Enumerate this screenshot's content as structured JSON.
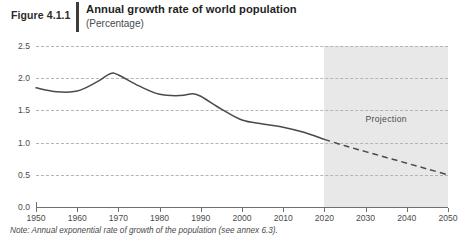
{
  "header": {
    "figure_number": "Figure 4.1.1",
    "title": "Annual growth rate of world population",
    "subtitle": "(Percentage)"
  },
  "note": "Note: Annual exponential rate of growth of the population (see annex 6.3).",
  "colors": {
    "line": "#4a4a4a",
    "grid": "#b4b4b4",
    "band": "#e8e8e8",
    "axis": "#6f6f6f",
    "text": "#4c4c4c"
  },
  "chart_data": {
    "type": "line",
    "title": "Annual growth rate of world population",
    "subtitle": "(Percentage)",
    "xlabel": "",
    "ylabel": "Percentage",
    "xlim": [
      1950,
      2050
    ],
    "ylim": [
      0.0,
      2.5
    ],
    "grid": true,
    "legend": false,
    "y_ticks": [
      "2.5",
      "2.0",
      "1.5",
      "1.0",
      "0.5",
      "0.0"
    ],
    "y_tick_values": [
      2.5,
      2.0,
      1.5,
      1.0,
      0.5,
      0.0
    ],
    "x_ticks": [
      "1950",
      "1960",
      "1970",
      "1980",
      "1990",
      "2000",
      "2010",
      "2020",
      "2030",
      "2040",
      "2050"
    ],
    "x_tick_values": [
      1950,
      1960,
      1970,
      1980,
      1990,
      2000,
      2010,
      2020,
      2030,
      2040,
      2050
    ],
    "annotations": [
      {
        "text": "Projection",
        "x": 2035,
        "y": 1.35
      }
    ],
    "shaded_region": {
      "label": "Projection",
      "x_start": 2020,
      "x_end": 2050
    },
    "series": [
      {
        "name": "Estimates",
        "style": "solid",
        "x": [
          1950,
          1955,
          1960,
          1965,
          1968,
          1970,
          1975,
          1980,
          1985,
          1988,
          1990,
          1995,
          2000,
          2005,
          2010,
          2015,
          2020
        ],
        "values": [
          1.85,
          1.79,
          1.8,
          1.95,
          2.07,
          2.05,
          1.88,
          1.75,
          1.73,
          1.76,
          1.72,
          1.52,
          1.35,
          1.29,
          1.24,
          1.16,
          1.05
        ]
      },
      {
        "name": "Projection",
        "style": "dashed",
        "x": [
          2020,
          2025,
          2030,
          2035,
          2040,
          2045,
          2050
        ],
        "values": [
          1.05,
          0.95,
          0.86,
          0.77,
          0.68,
          0.59,
          0.5
        ]
      }
    ]
  }
}
